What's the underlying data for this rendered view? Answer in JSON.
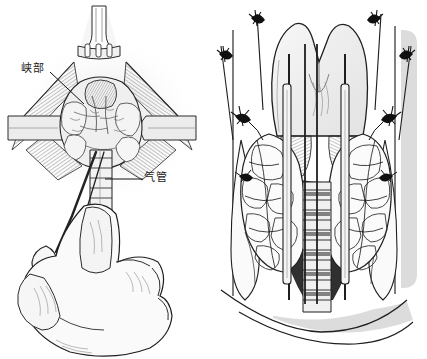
{
  "figure": {
    "background_color": "#ffffff",
    "ink_color": "#1a1a1a",
    "shadow_color": "#d8d8d8",
    "tissue_fill": "#f2f2f2",
    "width": 427,
    "height": 359
  },
  "labels": {
    "isthmus": "峡部",
    "trachea": "气管"
  },
  "panels": [
    {
      "id": "left",
      "name": "operative-field-view",
      "description": "Anterior neck operative field with skin retractors, exposed thyroid gland and surgeon's gloved hand holding a clamp",
      "parts": [
        "skin-retractor-top",
        "strap-muscle-left",
        "strap-muscle-right",
        "thyroid-isthmus",
        "thyroid-lobe-left",
        "thyroid-lobe-right",
        "trachea",
        "hemostat-clamp",
        "surgeon-hand"
      ]
    },
    {
      "id": "right",
      "name": "dissected-thyroid-view",
      "description": "Magnified dissected thyroid and larynx with thyroid cartilage, bilateral lobes, ligated vessel stumps and retractors over exposed tracheal rings",
      "parts": [
        "thyroid-cartilage",
        "cricothyroid-muscle",
        "thyroid-lobe-left",
        "thyroid-lobe-right",
        "tracheal-rings",
        "retractor-blade-left",
        "retractor-blade-right",
        "ligature-knot-upper-left",
        "ligature-knot-upper-right",
        "ligature-knot-mid-left",
        "ligature-knot-mid-right",
        "ligature-knot-lower-left",
        "ligature-knot-lower-right",
        "sternocleidomastoid-left",
        "sternocleidomastoid-right",
        "clavicle-sternum"
      ]
    }
  ]
}
